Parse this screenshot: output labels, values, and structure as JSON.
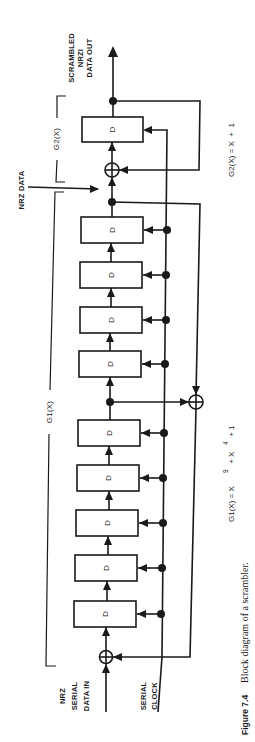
{
  "diagram": {
    "title": "Block diagram of a scrambler",
    "orientation": "rotated 90° counter-clockwise (signal flows bottom to top)",
    "labels": {
      "input_data": [
        "NRZ",
        "SERIAL",
        "DATA IN"
      ],
      "clock": [
        "SERIAL",
        "CLOCK"
      ],
      "nrz_data": "NRZ DATA",
      "output": [
        "SCRAMBLED",
        "NRZI",
        "DATA OUT"
      ],
      "g1_bracket": "G1(X)",
      "g2_bracket": "G2(X)",
      "register_cell": "D"
    },
    "equations": {
      "g1": {
        "prefix": "G1(X) = X",
        "exp1": "9",
        "mid": " + X",
        "exp2": "4",
        "suffix": " + 1"
      },
      "g2": {
        "text": "G2(X) = X  +  1"
      }
    },
    "g1_register_count": 9,
    "g1_tap_after_stage": 5,
    "g2_register_count": 1,
    "caption": {
      "figure": "Figure 7.4",
      "text": "Block diagram of a scrambler."
    }
  }
}
